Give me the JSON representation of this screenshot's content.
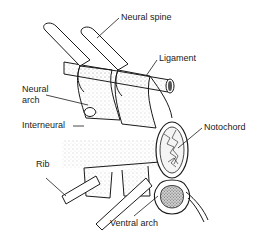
{
  "diagram": {
    "labels": {
      "neural_spine": "Neural spine",
      "ligament": "Ligament",
      "neural_arch_line1": "Neural",
      "neural_arch_line2": "arch",
      "interneural": "Interneural",
      "notochord": "Notochord",
      "rib": "Rib",
      "ventral_arch": "Ventral arch"
    },
    "colors": {
      "ink": "#1a1a1a",
      "background": "#ffffff",
      "stipple": "#9a9a9a"
    }
  }
}
